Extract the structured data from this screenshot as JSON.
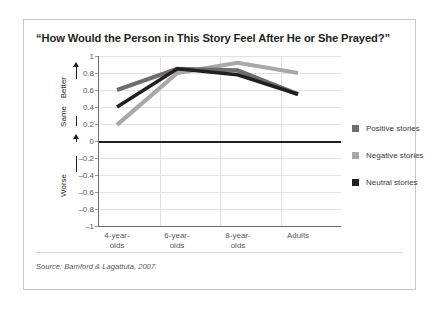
{
  "chart_data": {
    "type": "line",
    "title": "“How Would the Person in This Story Feel After He or She Prayed?”",
    "xlabel": "",
    "ylabel": "",
    "categories": [
      "4-year-olds",
      "6-year-olds",
      "8-year-olds",
      "Adults"
    ],
    "ylim": [
      -1,
      1
    ],
    "yticks": [
      1,
      0.8,
      0.6,
      0.4,
      0.2,
      0,
      -0.2,
      -0.4,
      -0.6,
      -0.8,
      -1
    ],
    "ytick_labels": [
      "1",
      "0.8",
      "0.6",
      "0.4",
      "0.2",
      "0",
      "–0.2",
      "–0.4",
      "–0.6",
      "–0.8",
      "–1"
    ],
    "grid": true,
    "legend_position": "right",
    "axis_annotations": [
      {
        "label": "Better",
        "direction": "up"
      },
      {
        "label": "Same",
        "direction": "up"
      },
      {
        "label": "Worse",
        "direction": "down"
      }
    ],
    "zero_line": 0,
    "series": [
      {
        "name": "Positive stories",
        "color": "#6e6e6e",
        "values": [
          0.6,
          0.85,
          0.83,
          0.55
        ]
      },
      {
        "name": "Negative stories",
        "color": "#a8a8a8",
        "values": [
          0.19,
          0.8,
          0.92,
          0.8
        ]
      },
      {
        "name": "Neutral stories",
        "color": "#231f20",
        "values": [
          0.4,
          0.85,
          0.78,
          0.55
        ]
      }
    ],
    "source": "Source: Bamford & Lagattuta, 2007."
  },
  "legend": {
    "items": [
      {
        "label": "Positive stories",
        "color": "#6e6e6e"
      },
      {
        "label": "Negative stories",
        "color": "#a8a8a8"
      },
      {
        "label": "Neutral stories",
        "color": "#231f20"
      }
    ]
  },
  "footer": {
    "source_prefix": "Source:",
    "source_text": "Bamford & Lagattuta, 2007.",
    "source_full": "Source: Bamford & Lagattuta, 2007."
  }
}
